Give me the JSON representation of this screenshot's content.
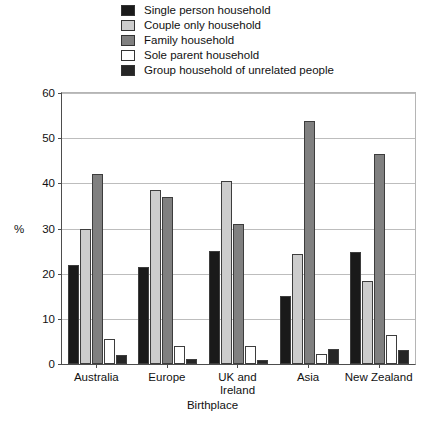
{
  "chart_data": {
    "type": "bar",
    "title": "",
    "xlabel": "Birthplace",
    "ylabel": "%",
    "ylim": [
      0,
      60
    ],
    "yticks": [
      0,
      10,
      20,
      30,
      40,
      50,
      60
    ],
    "grid": true,
    "legend_position": "top",
    "categories": [
      "Australia",
      "Europe",
      "UK and\nIreland",
      "Asia",
      "New Zealand"
    ],
    "category_labels": [
      [
        "Australia"
      ],
      [
        "Europe"
      ],
      [
        "UK and",
        "Ireland"
      ],
      [
        "Asia"
      ],
      [
        "New Zealand"
      ]
    ],
    "series": [
      {
        "name": "Single person household",
        "color": "#1a1a1a",
        "values": [
          22,
          21.5,
          25,
          15,
          24.8
        ]
      },
      {
        "name": "Couple only household",
        "color": "#cccccc",
        "values": [
          30,
          38.5,
          40.5,
          24.3,
          18.3
        ]
      },
      {
        "name": "Family household",
        "color": "#808080",
        "values": [
          42,
          37,
          31,
          53.7,
          46.5
        ]
      },
      {
        "name": "Sole parent household",
        "color": "#ffffff",
        "values": [
          5.5,
          4,
          4,
          2.3,
          6.5
        ]
      },
      {
        "name": "Group household of unrelated people",
        "color": "#262626",
        "values": [
          2,
          1,
          0.8,
          3.3,
          3
        ]
      }
    ]
  }
}
